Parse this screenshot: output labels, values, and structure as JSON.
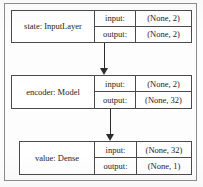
{
  "diagram": {
    "type": "keras-model-graph",
    "title": "",
    "colors": {
      "node_border": "#4a4a4a",
      "frame_border": "#8d8d8d",
      "arrow": "#2b2b2b",
      "background": "#fdfdfd",
      "text": "#1c1c1c"
    },
    "io_labels": {
      "input": "input:",
      "output": "output:"
    },
    "nodes": [
      {
        "id": "state",
        "title": "state: InputLayer",
        "input_label": "input:",
        "input_shape": "(None, 2)",
        "output_label": "output:",
        "output_shape": "(None, 2)"
      },
      {
        "id": "encoder",
        "title": "encoder: Model",
        "input_label": "input:",
        "input_shape": "(None, 2)",
        "output_label": "output:",
        "output_shape": "(None, 32)"
      },
      {
        "id": "value",
        "title": "value: Dense",
        "input_label": "input:",
        "input_shape": "(None, 32)",
        "output_label": "output:",
        "output_shape": "(None, 1)"
      }
    ],
    "edges": [
      {
        "id": "edge-state-encoder",
        "from": "state",
        "to": "encoder"
      },
      {
        "id": "edge-encoder-value",
        "from": "encoder",
        "to": "value"
      }
    ]
  }
}
